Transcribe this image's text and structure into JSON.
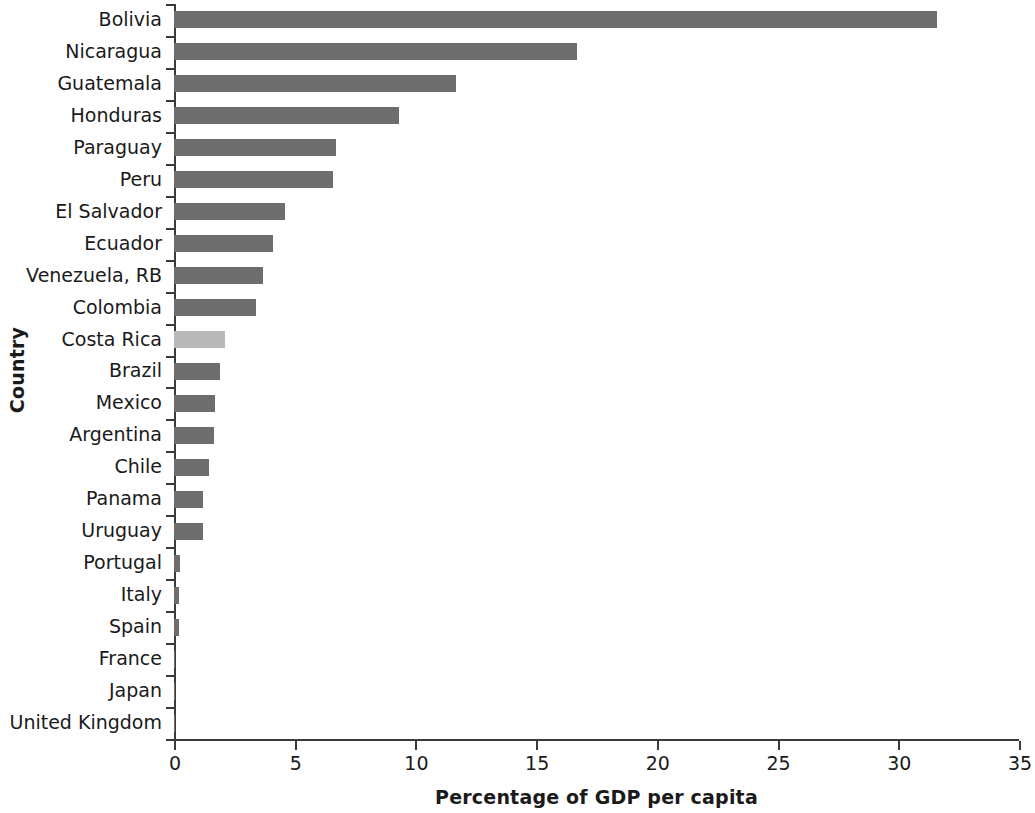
{
  "chart_data": {
    "type": "bar",
    "orientation": "horizontal",
    "title": "",
    "xlabel": "Percentage of GDP per capita",
    "ylabel": "Country",
    "xlim": [
      0,
      35
    ],
    "xticks": [
      0,
      5,
      10,
      15,
      20,
      25,
      30,
      35
    ],
    "grid": false,
    "legend": null,
    "categories": [
      "Bolivia",
      "Nicaragua",
      "Guatemala",
      "Honduras",
      "Paraguay",
      "Peru",
      "El Salvador",
      "Ecuador",
      "Venezuela, RB",
      "Colombia",
      "Costa Rica",
      "Brazil",
      "Mexico",
      "Argentina",
      "Chile",
      "Panama",
      "Uruguay",
      "Portugal",
      "Italy",
      "Spain",
      "France",
      "Japan",
      "United Kingdom"
    ],
    "values": [
      31.6,
      16.7,
      11.7,
      9.3,
      6.7,
      6.6,
      4.6,
      4.1,
      3.7,
      3.4,
      2.1,
      1.9,
      1.7,
      1.65,
      1.45,
      1.2,
      1.2,
      0.25,
      0.22,
      0.2,
      0.05,
      0.03,
      0.02
    ],
    "highlight_category": "Costa Rica",
    "colors": {
      "bar": "#6e6e6e",
      "bar_highlight": "#b9b9b9",
      "axis": "#3a3a3a",
      "text": "#1a1a1a",
      "background": "#ffffff"
    }
  }
}
